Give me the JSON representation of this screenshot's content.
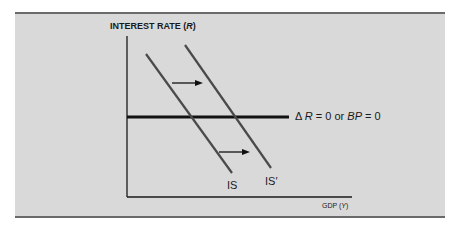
{
  "diagram": {
    "y_axis_label": "INTEREST RATE (R)",
    "y_axis_label_parts": {
      "text": "INTEREST RATE (",
      "var": "R",
      "close": ")"
    },
    "x_axis_label_parts": {
      "text": "GDP (",
      "var": "Y",
      "close": ")"
    },
    "horizontal_line_label": {
      "delta": "Δ",
      "var1": "R",
      "mid": " = 0 or ",
      "var2": "BP",
      "end": " = 0"
    },
    "curves": [
      {
        "name": "IS",
        "label": "IS"
      },
      {
        "name": "IS-shifted",
        "label": "IS′"
      }
    ],
    "arrows": [
      {
        "name": "shift-arrow-upper",
        "direction": "right"
      },
      {
        "name": "shift-arrow-lower",
        "direction": "right"
      }
    ],
    "colors": {
      "panel": "#d9d9d9",
      "line": "#1a1a1a",
      "curve": "#4a4a4a",
      "border": "#6a6a6a"
    }
  }
}
